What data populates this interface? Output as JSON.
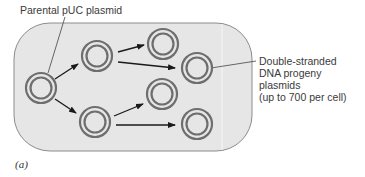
{
  "figure": {
    "caption": "(a)",
    "cell": {
      "fill": "#e6e6e6",
      "stroke": "#8c8c8c"
    },
    "plasmid_color": "#6e6e6e",
    "arrow_color": "#1a1a1a",
    "labels": {
      "parental": "Parental pUC plasmid",
      "progeny_lines": [
        "Double-stranded",
        "DNA progeny",
        "plasmids",
        "(up to 700 per cell)"
      ]
    },
    "plasmids": [
      {
        "id": "parental",
        "cx": 41,
        "cy": 88
      },
      {
        "id": "gen1-top",
        "cx": 97,
        "cy": 56
      },
      {
        "id": "gen1-bottom",
        "cx": 95,
        "cy": 122
      },
      {
        "id": "gen2-a",
        "cx": 163,
        "cy": 44
      },
      {
        "id": "gen2-b",
        "cx": 197,
        "cy": 68
      },
      {
        "id": "gen2-c",
        "cx": 162,
        "cy": 94
      },
      {
        "id": "gen2-d",
        "cx": 197,
        "cy": 124
      }
    ]
  }
}
